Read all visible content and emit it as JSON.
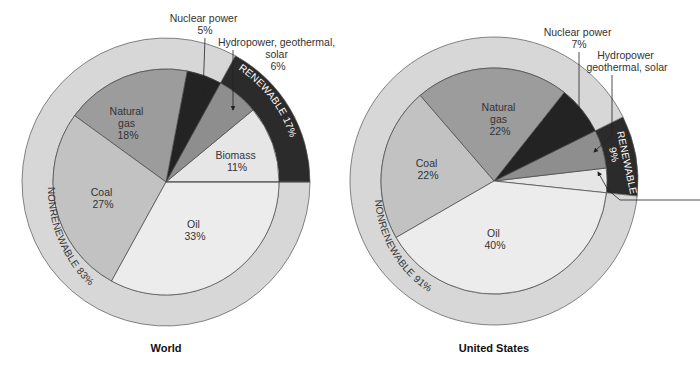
{
  "chart_data": [
    {
      "type": "pie",
      "title": "World",
      "center": [
        166,
        182
      ],
      "inner_radius": 113,
      "outer_radius": 144,
      "start_angle_deg": 0,
      "slices": [
        {
          "key": "biomass",
          "label": "Biomass",
          "value": 11,
          "value_text": "11%",
          "color": "#e6e6e6",
          "category": "renewable"
        },
        {
          "key": "hydro",
          "label": "Hydropower, geothermal, solar",
          "value": 6,
          "value_text": "6%",
          "color": "#8e8e8e",
          "category": "renewable"
        },
        {
          "key": "nuclear",
          "label": "Nuclear power",
          "value": 5,
          "value_text": "5%",
          "color": "#232323",
          "category": "nonrenewable"
        },
        {
          "key": "natural_gas",
          "label": "Natural gas",
          "value": 18,
          "value_text": "18%",
          "color": "#9c9c9c",
          "category": "nonrenewable"
        },
        {
          "key": "coal",
          "label": "Coal",
          "value": 27,
          "value_text": "27%",
          "color": "#c2c2c2",
          "category": "nonrenewable"
        },
        {
          "key": "oil",
          "label": "Oil",
          "value": 33,
          "value_text": "33%",
          "color": "#ececec",
          "category": "nonrenewable"
        }
      ],
      "ring": [
        {
          "label": "RENEWABLE 17%",
          "value": 17,
          "color": "#2b2b2b",
          "text_color": "#ffffff"
        },
        {
          "label": "NONRENEWABLE 83%",
          "value": 83,
          "color": "#d7d7d7",
          "text_color": "#333333"
        }
      ]
    },
    {
      "type": "pie",
      "title": "United States",
      "center": [
        494,
        181
      ],
      "inner_radius": 113,
      "outer_radius": 144,
      "start_angle_deg": -6,
      "slices": [
        {
          "key": "biomass",
          "label": "",
          "value": 3.5,
          "value_text": "",
          "color": "#e6e6e6",
          "category": "renewable"
        },
        {
          "key": "hydro",
          "label": "Hydropower geothermal, solar",
          "value": 5.5,
          "value_text": "",
          "color": "#8e8e8e",
          "category": "renewable"
        },
        {
          "key": "nuclear",
          "label": "Nuclear power",
          "value": 7,
          "value_text": "7%",
          "color": "#232323",
          "category": "nonrenewable"
        },
        {
          "key": "natural_gas",
          "label": "Natural gas",
          "value": 22,
          "value_text": "22%",
          "color": "#9c9c9c",
          "category": "nonrenewable"
        },
        {
          "key": "coal",
          "label": "Coal",
          "value": 22,
          "value_text": "22%",
          "color": "#c2c2c2",
          "category": "nonrenewable"
        },
        {
          "key": "oil",
          "label": "Oil",
          "value": 40,
          "value_text": "40%",
          "color": "#ececec",
          "category": "nonrenewable"
        }
      ],
      "ring": [
        {
          "label": "RENEWABLE 9%",
          "value": 9,
          "color": "#2b2b2b",
          "text_color": "#ffffff"
        },
        {
          "label": "NONRENEWABLE 91%",
          "value": 91,
          "color": "#d7d7d7",
          "text_color": "#333333"
        }
      ]
    }
  ],
  "world": {
    "title": "World",
    "labels": {
      "natural_gas": [
        "Natural",
        "gas",
        "18%"
      ],
      "coal": [
        "Coal",
        "27%"
      ],
      "oil": [
        "Oil",
        "33%"
      ],
      "biomass": [
        "Biomass",
        "11%"
      ]
    },
    "callouts": {
      "nuclear": [
        "Nuclear power",
        "5%"
      ],
      "hydro": [
        "Hydropower, geothermal,",
        "solar",
        "6%"
      ]
    },
    "ring_labels": {
      "renewable": "RENEWABLE 17%",
      "nonrenewable": "NONRENEWABLE 83%"
    }
  },
  "us": {
    "title": "United States",
    "labels": {
      "natural_gas": [
        "Natural",
        "gas",
        "22%"
      ],
      "coal": [
        "Coal",
        "22%"
      ],
      "oil": [
        "Oil",
        "40%"
      ]
    },
    "callouts": {
      "nuclear": [
        "Nuclear power",
        "7%"
      ],
      "hydro": [
        "Hydropower",
        "geothermal, solar"
      ]
    },
    "ring_labels": {
      "renewable_1": "RENEWABLE",
      "renewable_2": "9%",
      "nonrenewable": "NONRENEWABLE 91%"
    }
  }
}
